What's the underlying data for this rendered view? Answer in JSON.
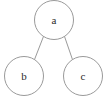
{
  "diagram": {
    "type": "tree-graph",
    "title": "",
    "background_color": "#ffffff",
    "stroke_color": "#9a9a9a",
    "label_color": "#2b2b2b",
    "node_fill": "#ffffff",
    "nodes": [
      {
        "id": "a",
        "label": "a",
        "cx": 54,
        "cy": 20,
        "r": 19.5,
        "role": "root"
      },
      {
        "id": "b",
        "label": "b",
        "cx": 24,
        "cy": 76,
        "r": 19.5,
        "role": "child"
      },
      {
        "id": "c",
        "label": "c",
        "cx": 83,
        "cy": 76,
        "r": 19.5,
        "role": "child"
      }
    ],
    "edges": [
      {
        "from": "a",
        "to": "b",
        "x1": 43.5,
        "y1": 36.4,
        "x2": 34.5,
        "y2": 59.6
      },
      {
        "from": "a",
        "to": "c",
        "x1": 64.5,
        "y1": 36.4,
        "x2": 72.5,
        "y2": 59.6
      }
    ]
  }
}
